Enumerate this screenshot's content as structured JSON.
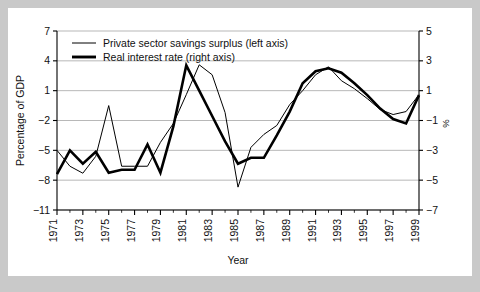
{
  "figure": {
    "background_color": "#c9c9c9",
    "card_color": "#ffffff",
    "line_color": "#000000",
    "grid_color": "#9a9a9a"
  },
  "chart_data": {
    "type": "line",
    "title": "",
    "subtitle": "",
    "xlabel": "Year",
    "ylabel": "Percentage of GDP",
    "y2label": "%",
    "grid": true,
    "legend_position": "top-left",
    "xlim": [
      1971,
      1999
    ],
    "ylim": [
      -11,
      7
    ],
    "y2lim": [
      -7,
      5
    ],
    "yticks": [
      7,
      4,
      1,
      -2,
      -5,
      -8,
      -11
    ],
    "yticklabels": [
      "7",
      "4",
      "1",
      "−2",
      "−5",
      "−8",
      "−11"
    ],
    "y2ticks": [
      5,
      3,
      1,
      -1,
      -3,
      -5,
      -7
    ],
    "y2ticklabels": [
      "5",
      "3",
      "1",
      "−1",
      "−3",
      "−5",
      "−7"
    ],
    "xticks": [
      1971,
      1973,
      1975,
      1977,
      1979,
      1981,
      1983,
      1985,
      1987,
      1989,
      1991,
      1993,
      1995,
      1997,
      1999
    ],
    "xticklabels": [
      "1971",
      "1973",
      "1975",
      "1977",
      "1979",
      "1981",
      "1983",
      "1985",
      "1987",
      "1989",
      "1991",
      "1993",
      "1995",
      "1997",
      "1999"
    ],
    "x": [
      1971,
      1972,
      1973,
      1974,
      1975,
      1976,
      1977,
      1978,
      1979,
      1980,
      1981,
      1982,
      1983,
      1984,
      1985,
      1986,
      1987,
      1988,
      1989,
      1990,
      1991,
      1992,
      1993,
      1994,
      1995,
      1996,
      1997,
      1998,
      1999
    ],
    "series": [
      {
        "name": "Private sector savings surplus (left axis)",
        "axis": "left",
        "style": "thin",
        "linewidth": 1.0,
        "color": "#000000",
        "values": [
          -5.0,
          -6.6,
          -7.3,
          -5.6,
          -0.5,
          -6.6,
          -6.6,
          -6.6,
          -4.2,
          -2.3,
          0.6,
          3.6,
          2.6,
          -1.2,
          -8.7,
          -4.7,
          -3.4,
          -2.5,
          -0.4,
          1.0,
          2.6,
          3.4,
          2.0,
          1.2,
          0.2,
          -0.9,
          -1.4,
          -1.1,
          0.6
        ]
      },
      {
        "name": "Real interest rate (right axis)",
        "axis": "right",
        "style": "thick",
        "linewidth": 2.6,
        "color": "#000000",
        "values": [
          -4.6,
          -3.0,
          -3.9,
          -3.1,
          -4.5,
          -4.3,
          -4.3,
          -2.6,
          -4.5,
          -1.4,
          2.7,
          1.0,
          -0.7,
          -2.4,
          -3.9,
          -3.5,
          -3.5,
          -2.0,
          -0.4,
          1.5,
          2.3,
          2.5,
          2.2,
          1.5,
          0.7,
          -0.2,
          -0.9,
          -1.2,
          0.7
        ]
      }
    ]
  },
  "legend": {
    "items": [
      {
        "label": "Private sector savings surplus (left axis)",
        "style": "thin"
      },
      {
        "label": "Real interest rate (right axis)",
        "style": "thick"
      }
    ]
  }
}
